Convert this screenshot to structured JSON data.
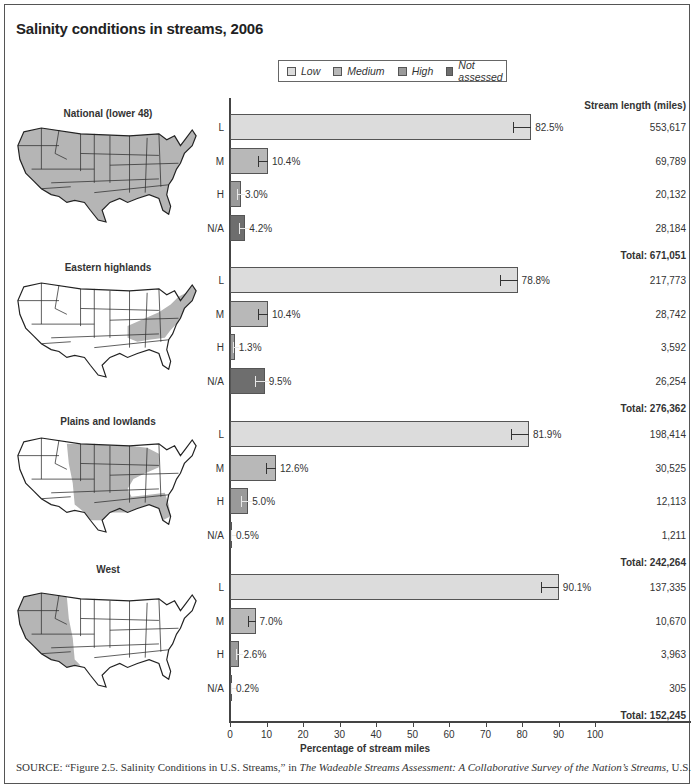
{
  "title": "Salinity conditions in streams, 2006",
  "legend": [
    {
      "label": "Low",
      "color": "#dcdcdc"
    },
    {
      "label": "Medium",
      "color": "#b8b8b8"
    },
    {
      "label": "High",
      "color": "#9a9a9a"
    },
    {
      "label": "Not assessed",
      "color": "#6e6e6e"
    }
  ],
  "column_header": "Stream length (miles)",
  "x_axis": {
    "title": "Percentage of stream miles",
    "ticks": [
      "0",
      "10",
      "20",
      "30",
      "40",
      "50",
      "60",
      "70",
      "80",
      "90",
      "100"
    ]
  },
  "regions": [
    {
      "name": "National (lower 48)",
      "total": "Total: 671,051",
      "rows": [
        {
          "code": "L",
          "pct": "82.5%",
          "miles": "553,617"
        },
        {
          "code": "M",
          "pct": "10.4%",
          "miles": "69,789"
        },
        {
          "code": "H",
          "pct": "3.0%",
          "miles": "20,132"
        },
        {
          "code": "N/A",
          "pct": "4.2%",
          "miles": "28,184"
        }
      ]
    },
    {
      "name": "Eastern highlands",
      "total": "Total: 276,362",
      "rows": [
        {
          "code": "L",
          "pct": "78.8%",
          "miles": "217,773"
        },
        {
          "code": "M",
          "pct": "10.4%",
          "miles": "28,742"
        },
        {
          "code": "H",
          "pct": "1.3%",
          "miles": "3,592"
        },
        {
          "code": "N/A",
          "pct": "9.5%",
          "miles": "26,254"
        }
      ]
    },
    {
      "name": "Plains and lowlands",
      "total": "Total: 242,264",
      "rows": [
        {
          "code": "L",
          "pct": "81.9%",
          "miles": "198,414"
        },
        {
          "code": "M",
          "pct": "12.6%",
          "miles": "30,525"
        },
        {
          "code": "H",
          "pct": "5.0%",
          "miles": "12,113"
        },
        {
          "code": "N/A",
          "pct": "0.5%",
          "miles": "1,211"
        }
      ]
    },
    {
      "name": "West",
      "total": "Total: 152,245",
      "rows": [
        {
          "code": "L",
          "pct": "90.1%",
          "miles": "137,335"
        },
        {
          "code": "M",
          "pct": "7.0%",
          "miles": "10,670"
        },
        {
          "code": "H",
          "pct": "2.6%",
          "miles": "3,963"
        },
        {
          "code": "N/A",
          "pct": "0.2%",
          "miles": "305"
        }
      ]
    }
  ],
  "source": {
    "prefix": "SOURCE: “Figure 2.5. Salinity Conditions in U.S. Streams,” in ",
    "italic": "The Wadeable Streams Assessment: A Collaborative Survey of the Nation’s Streams",
    "suffix": ", U.S."
  },
  "chart_data": {
    "type": "bar",
    "orientation": "horizontal",
    "title": "Salinity conditions in streams, 2006",
    "xlabel": "Percentage of stream miles",
    "ylabel": "",
    "xlim": [
      0,
      100
    ],
    "x_ticks": [
      0,
      10,
      20,
      30,
      40,
      50,
      60,
      70,
      80,
      90,
      100
    ],
    "grid": false,
    "legend": {
      "position": "top",
      "entries": [
        "Low",
        "Medium",
        "High",
        "Not assessed"
      ]
    },
    "categories": [
      "L",
      "M",
      "H",
      "N/A"
    ],
    "category_meaning": {
      "L": "Low",
      "M": "Medium",
      "H": "High",
      "N/A": "Not assessed"
    },
    "error_bars": true,
    "panels": [
      {
        "name": "National (lower 48)",
        "values": [
          82.5,
          10.4,
          3.0,
          4.2
        ],
        "stream_length_miles": [
          553617,
          69789,
          20132,
          28184
        ],
        "total_miles": 671051
      },
      {
        "name": "Eastern highlands",
        "values": [
          78.8,
          10.4,
          1.3,
          9.5
        ],
        "stream_length_miles": [
          217773,
          28742,
          3592,
          26254
        ],
        "total_miles": 276362
      },
      {
        "name": "Plains and lowlands",
        "values": [
          81.9,
          12.6,
          5.0,
          0.5
        ],
        "stream_length_miles": [
          198414,
          30525,
          12113,
          1211
        ],
        "total_miles": 242264
      },
      {
        "name": "West",
        "values": [
          90.1,
          7.0,
          2.6,
          0.2
        ],
        "stream_length_miles": [
          137335,
          10670,
          3963,
          305
        ],
        "total_miles": 152245
      }
    ],
    "series": [
      {
        "name": "Low",
        "values": [
          82.5,
          78.8,
          81.9,
          90.1
        ]
      },
      {
        "name": "Medium",
        "values": [
          10.4,
          10.4,
          12.6,
          7.0
        ]
      },
      {
        "name": "High",
        "values": [
          3.0,
          1.3,
          5.0,
          2.6
        ]
      },
      {
        "name": "Not assessed",
        "values": [
          4.2,
          9.5,
          0.5,
          0.2
        ]
      }
    ],
    "series_categories": [
      "National (lower 48)",
      "Eastern highlands",
      "Plains and lowlands",
      "West"
    ]
  }
}
